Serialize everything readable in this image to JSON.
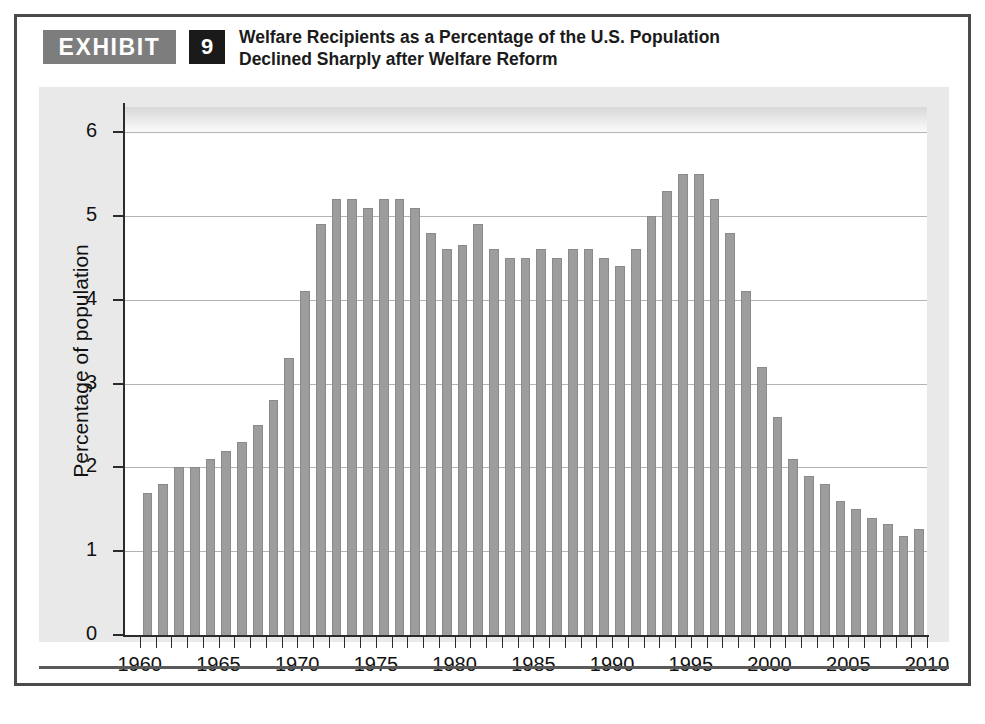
{
  "exhibit": {
    "tag_label": "EXHIBIT",
    "number": "9",
    "title_line1": "Welfare Recipients as a Percentage of the U.S. Population",
    "title_line2": "Declined Sharply after Welfare Reform"
  },
  "colors": {
    "bar_fill": "#9d9d9d",
    "bar_stroke": "#8a8a8a",
    "panel_background": "#e9e9e9",
    "plot_background": "#ffffff",
    "gridline": "#b4b4b4",
    "axis": "#2b2b2b",
    "tag_background": "#7d7d7d",
    "number_background": "#1a1a1a",
    "figure_border": "#4a4a4a"
  },
  "chart_data": {
    "type": "bar",
    "title": "Welfare Recipients as a Percentage of the U.S. Population Declined Sharply after Welfare Reform",
    "xlabel": "",
    "ylabel": "Percentage of population",
    "ylim": [
      0,
      6.3
    ],
    "xlim": [
      1959,
      2010
    ],
    "grid": true,
    "legend": null,
    "ytick_labels": [
      "0",
      "1",
      "2",
      "3",
      "4",
      "5",
      "6"
    ],
    "ytick_values": [
      0,
      1,
      2,
      3,
      4,
      5,
      6
    ],
    "xtick_labels": [
      "1960",
      "1965",
      "1970",
      "1975",
      "1980",
      "1985",
      "1990",
      "1995",
      "2000",
      "2005",
      "2010"
    ],
    "xtick_values": [
      1960,
      1965,
      1970,
      1975,
      1980,
      1985,
      1990,
      1995,
      2000,
      2005,
      2010
    ],
    "categories": [
      1960,
      1961,
      1962,
      1963,
      1964,
      1965,
      1966,
      1967,
      1968,
      1969,
      1970,
      1971,
      1972,
      1973,
      1974,
      1975,
      1976,
      1977,
      1978,
      1979,
      1980,
      1981,
      1982,
      1983,
      1984,
      1985,
      1986,
      1987,
      1988,
      1989,
      1990,
      1991,
      1992,
      1993,
      1994,
      1995,
      1996,
      1997,
      1998,
      1999,
      2000,
      2001,
      2002,
      2003,
      2004,
      2005,
      2006,
      2007,
      2008,
      2009
    ],
    "values": [
      1.7,
      1.8,
      2.0,
      2.0,
      2.1,
      2.2,
      2.3,
      2.5,
      2.8,
      3.3,
      4.1,
      4.9,
      5.2,
      5.2,
      5.1,
      5.2,
      5.2,
      5.1,
      4.8,
      4.6,
      4.65,
      4.9,
      4.6,
      4.5,
      4.5,
      4.6,
      4.5,
      4.6,
      4.6,
      4.5,
      4.4,
      4.6,
      5.0,
      5.3,
      5.5,
      5.5,
      5.2,
      4.8,
      4.1,
      3.2,
      2.6,
      2.1,
      1.9,
      1.8,
      1.6,
      1.5,
      1.4,
      1.33,
      1.18,
      1.27
    ]
  }
}
